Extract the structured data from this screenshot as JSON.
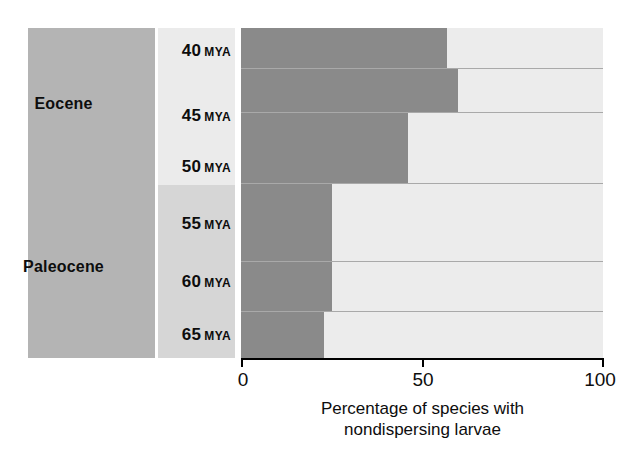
{
  "chart_data": {
    "type": "bar",
    "orientation": "horizontal",
    "title": "",
    "xlabel": "Percentage of species with nondispersing larvae",
    "ylabel": "",
    "xlim": [
      0,
      100
    ],
    "xticks": [
      0,
      50,
      100
    ],
    "xtick_labels": [
      "0",
      "50",
      "100"
    ],
    "grid": false,
    "legend": null,
    "categories": [
      "40 MYA",
      "45 MYA",
      "50 MYA",
      "55 MYA",
      "60 MYA",
      "65 MYA"
    ],
    "values": [
      57,
      60,
      46,
      25,
      25,
      23
    ],
    "series": [
      {
        "name": "nondispersing larvae",
        "values": [
          57,
          60,
          46,
          25,
          25,
          23
        ],
        "color": "#8a8a8a"
      },
      {
        "name": "remainder",
        "values": [
          43,
          40,
          54,
          75,
          75,
          77
        ],
        "color": "#ececec"
      }
    ],
    "epochs": [
      {
        "name": "Eocene",
        "rows": [
          0,
          1,
          2
        ]
      },
      {
        "name": "Paleocene",
        "rows": [
          3,
          4,
          5
        ]
      }
    ]
  },
  "epoch_column": {
    "name": "geologic-epoch-column",
    "background": "#b4b4b4",
    "labels": [
      {
        "text": "Eocene"
      },
      {
        "text": "Paleocene"
      }
    ]
  },
  "time_column": {
    "name": "time-scale-column",
    "background_upper": "#ebebeb",
    "background_lower": "#d6d6d6",
    "rows": [
      {
        "value": "40",
        "unit": "MYA"
      },
      {
        "value": "45",
        "unit": "MYA"
      },
      {
        "value": "50",
        "unit": "MYA"
      },
      {
        "value": "55",
        "unit": "MYA"
      },
      {
        "value": "60",
        "unit": "MYA"
      },
      {
        "value": "65",
        "unit": "MYA"
      }
    ]
  },
  "axis": {
    "ticks": [
      {
        "label": "0",
        "value": 0
      },
      {
        "label": "50",
        "value": 50
      },
      {
        "label": "100",
        "value": 100
      }
    ],
    "caption_line1": "Percentage of species with",
    "caption_line2": "nondispersing larvae"
  },
  "colors": {
    "bar_dark": "#8a8a8a",
    "bar_light": "#ececec",
    "epoch_panel": "#b4b4b4",
    "time_panel_upper": "#ebebeb",
    "time_panel_lower": "#d6d6d6",
    "axis": "#000000",
    "separator": "#a9a9a9"
  }
}
